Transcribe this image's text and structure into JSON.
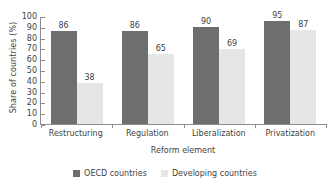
{
  "chart_data": {
    "type": "bar",
    "title": "",
    "xlabel": "Reform element",
    "ylabel": "Share of countries (%)",
    "categories": [
      "Restructuring",
      "Regulation",
      "Liberalization",
      "Privatization"
    ],
    "series": [
      {
        "name": "OECD countries",
        "color": "#6e6e6e",
        "values": [
          86,
          86,
          90,
          95
        ]
      },
      {
        "name": "Developing countries",
        "color": "#e6e6e6",
        "values": [
          38,
          65,
          69,
          87
        ]
      }
    ],
    "ylim": [
      0,
      100
    ],
    "yticks": [
      0,
      10,
      20,
      30,
      40,
      50,
      60,
      70,
      80,
      90,
      100
    ],
    "grid": false,
    "legend_position": "bottom",
    "data_labels": true
  }
}
